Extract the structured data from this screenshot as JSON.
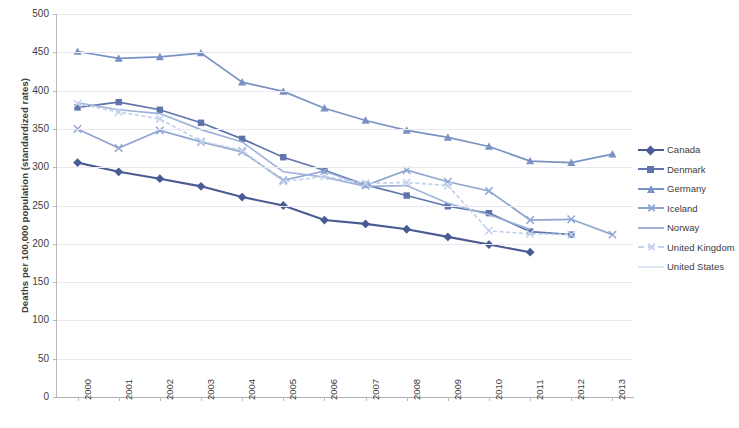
{
  "chart_data": {
    "type": "line",
    "title": "",
    "xlabel": "",
    "ylabel": "Deaths per 100,000 population (standardized rates)",
    "x": [
      2000,
      2001,
      2002,
      2003,
      2004,
      2005,
      2006,
      2007,
      2008,
      2009,
      2010,
      2011,
      2012,
      2013
    ],
    "xtick_labels": [
      "2000",
      "2001",
      "2002",
      "2003",
      "2004",
      "2005",
      "2006",
      "2007",
      "2008",
      "2009",
      "2010",
      "2011",
      "2012",
      "2013"
    ],
    "ytick_labels": [
      "0",
      "50",
      "100",
      "150",
      "200",
      "250",
      "300",
      "350",
      "400",
      "450",
      "500"
    ],
    "yticks": [
      0,
      50,
      100,
      150,
      200,
      250,
      300,
      350,
      400,
      450,
      500
    ],
    "ylim": [
      0,
      500
    ],
    "grid": true,
    "legend_position": "right",
    "series": [
      {
        "name": "Canada",
        "color": "#4a5b94",
        "marker": "diamond",
        "dashed": false,
        "values": [
          306,
          294,
          285,
          275,
          261,
          250,
          231,
          226,
          219,
          209,
          199,
          189,
          null,
          null
        ]
      },
      {
        "name": "Denmark",
        "color": "#5f74ad",
        "marker": "square",
        "dashed": false,
        "values": [
          378,
          385,
          375,
          358,
          337,
          313,
          296,
          277,
          263,
          249,
          240,
          216,
          212,
          null
        ]
      },
      {
        "name": "Germany",
        "color": "#7b92c4",
        "marker": "triangle",
        "dashed": false,
        "values": [
          451,
          442,
          444,
          449,
          411,
          399,
          377,
          361,
          348,
          339,
          327,
          308,
          306,
          317
        ]
      },
      {
        "name": "Iceland",
        "color": "#8fa5d2",
        "marker": "x",
        "dashed": false,
        "values": [
          350,
          325,
          348,
          333,
          320,
          283,
          295,
          276,
          296,
          281,
          269,
          231,
          232,
          212
        ]
      },
      {
        "name": "Norway",
        "color": "#9fb3da",
        "marker": "none",
        "dashed": false,
        "values": [
          384,
          375,
          370,
          349,
          333,
          294,
          287,
          275,
          276,
          253,
          238,
          219,
          null,
          null
        ]
      },
      {
        "name": "United Kingdom",
        "color": "#c2d2ec",
        "marker": "x",
        "dashed": true,
        "values": [
          383,
          372,
          363,
          334,
          322,
          281,
          288,
          279,
          280,
          276,
          217,
          213,
          212,
          null
        ]
      },
      {
        "name": "United States",
        "color": "#dce6f5",
        "marker": "none",
        "dashed": false,
        "values": [
          null,
          null,
          null,
          null,
          null,
          null,
          null,
          null,
          null,
          278,
          null,
          null,
          null,
          null
        ]
      }
    ]
  },
  "legend": {
    "items": [
      {
        "label": "Canada"
      },
      {
        "label": "Denmark"
      },
      {
        "label": "Germany"
      },
      {
        "label": "Iceland"
      },
      {
        "label": "Norway"
      },
      {
        "label": "United Kingdom"
      },
      {
        "label": "United States"
      }
    ]
  }
}
